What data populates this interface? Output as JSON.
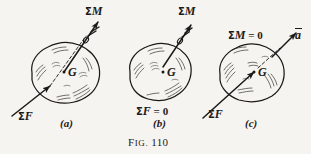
{
  "figure": {
    "caption_lead": "F",
    "caption_rest": "IG.",
    "caption_number": "110",
    "caption_full": "Fig. 110",
    "background_color": "#f6f4f0",
    "ink_color": "#1c1a18"
  },
  "panels": [
    {
      "id": "a",
      "tag": "(a)",
      "center_of_mass_label": "G",
      "labels": {
        "moment": {
          "sigma": "Σ",
          "var": "M",
          "text": "ΣM"
        },
        "force": {
          "sigma": "Σ",
          "var": "F",
          "text": "ΣF"
        }
      },
      "description": "General motion: resultant force ΣF and resultant moment ΣM both nonzero"
    },
    {
      "id": "b",
      "tag": "(b)",
      "center_of_mass_label": "G",
      "labels": {
        "moment": {
          "sigma": "Σ",
          "var": "M",
          "text": "ΣM"
        },
        "force_zero": {
          "sigma": "Σ",
          "var": "F",
          "eq": " = 0",
          "text": "ΣF = 0"
        }
      },
      "description": "Pure rotation: ΣF = 0, moment ΣM nonzero"
    },
    {
      "id": "c",
      "tag": "(c)",
      "center_of_mass_label": "G",
      "labels": {
        "moment_zero": {
          "sigma": "Σ",
          "var": "M",
          "eq": " = 0",
          "text": "ΣM = 0"
        },
        "force": {
          "sigma": "Σ",
          "var": "F",
          "text": "ΣF"
        },
        "acceleration": {
          "var": "a",
          "text": "ā"
        }
      },
      "description": "Pure translation: ΣM = 0, acceleration vector a along ΣF"
    }
  ],
  "icons": {
    "moment_vector": "double-arrowhead-vector-icon",
    "force_vector": "single-arrowhead-vector-icon",
    "acceleration_vector": "single-arrowhead-vector-icon",
    "center-of-mass-dot": "filled-dot-icon"
  }
}
